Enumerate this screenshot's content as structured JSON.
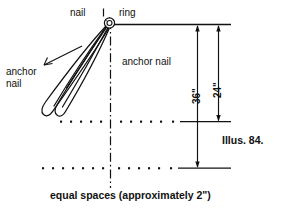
{
  "figure": {
    "title": "Illus. 84.",
    "caption": "equal spaces (approximately 2\")",
    "labels": {
      "nail": "nail",
      "ring": "ring",
      "anchor_nail_left": "anchor\nnail",
      "anchor_nail_left_line1": "anchor",
      "anchor_nail_left_line2": "nail",
      "anchor_nail_middle": "anchor nail"
    },
    "dimensions": [
      {
        "name": "inner-dimension",
        "value": "36\"",
        "from": "ring-line",
        "to": "middle-dotted-line"
      },
      {
        "name": "outer-dimension",
        "value": "24\"",
        "from": "ring-line",
        "to": "bottom-dotted-line"
      }
    ],
    "colors": {
      "ink": "#111111",
      "background": "#ffffff"
    },
    "elements": {
      "ring_icon": "ring-icon",
      "centerline": "dash-dot-centerline",
      "dotted_rows": 2,
      "anchor_loops": 2
    }
  }
}
